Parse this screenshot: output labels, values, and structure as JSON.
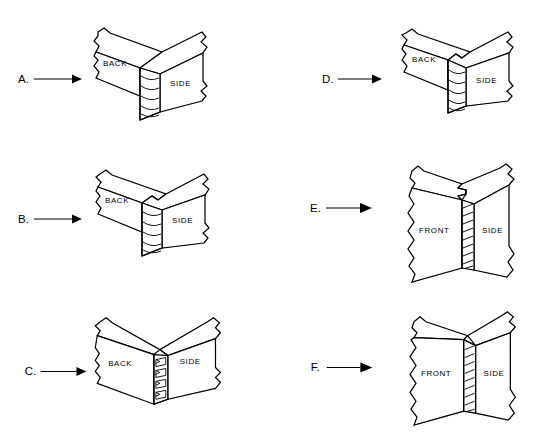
{
  "figure": {
    "background_color": "#ffffff",
    "ink_color": "#000000",
    "columns": 2,
    "rows": 3,
    "panel_count": 6
  },
  "panels": [
    {
      "id": "a",
      "letter": "A.",
      "joint_name": "butt-joint-back-to-side",
      "orientation": "horizontal-boards-top-view",
      "labels": {
        "left_board": "BACK",
        "right_board": "SIDE"
      },
      "endgrain_visible": true,
      "endgrain_position": "center-vertical-strip",
      "pin_count": 0
    },
    {
      "id": "b",
      "letter": "B.",
      "joint_name": "rabbet-joint-back-to-side",
      "orientation": "horizontal-boards-top-view",
      "labels": {
        "left_board": "BACK",
        "right_board": "SIDE"
      },
      "endgrain_visible": true,
      "endgrain_position": "center-vertical-strip",
      "pin_count": 0
    },
    {
      "id": "c",
      "letter": "C.",
      "joint_name": "dovetail-joint-back-to-side",
      "orientation": "horizontal-boards-top-view",
      "labels": {
        "left_board": "BACK",
        "right_board": "SIDE"
      },
      "endgrain_visible": false,
      "endgrain_position": "center-vertical-strip",
      "pin_count": 3
    },
    {
      "id": "d",
      "letter": "D.",
      "joint_name": "dado-rabbet-joint-back-to-side",
      "orientation": "horizontal-boards-top-view",
      "labels": {
        "left_board": "BACK",
        "right_board": "SIDE"
      },
      "endgrain_visible": true,
      "endgrain_position": "center-vertical-strip",
      "pin_count": 0
    },
    {
      "id": "e",
      "letter": "E.",
      "joint_name": "lock-joint-front-to-side",
      "orientation": "vertical-boards-corner-view",
      "labels": {
        "left_board": "FRONT",
        "right_board": "SIDE"
      },
      "endgrain_visible": true,
      "endgrain_position": "center-vertical-strip",
      "pin_count": 0
    },
    {
      "id": "f",
      "letter": "F.",
      "joint_name": "butt-joint-front-to-side",
      "orientation": "vertical-boards-corner-view",
      "labels": {
        "left_board": "FRONT",
        "right_board": "SIDE"
      },
      "endgrain_visible": true,
      "endgrain_position": "center-vertical-strip",
      "pin_count": 0
    }
  ]
}
